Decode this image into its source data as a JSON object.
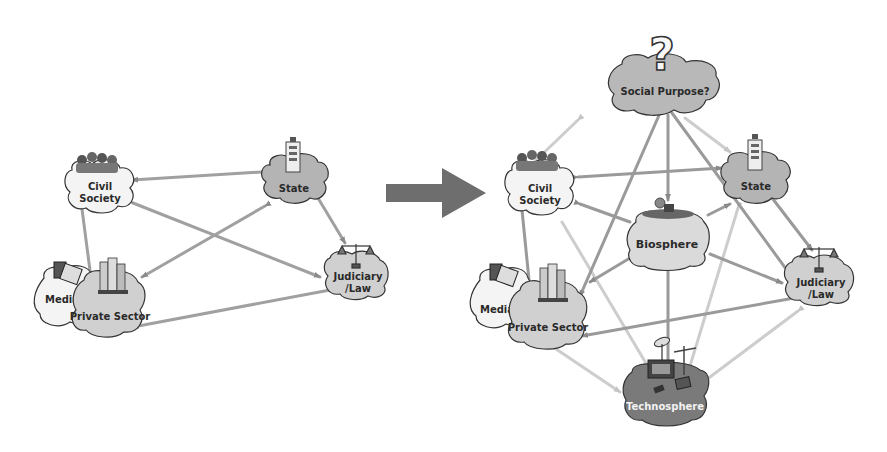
{
  "colors": {
    "cloud_white": "#f4f4f4",
    "cloud_light": "#d6d6d6",
    "cloud_mid": "#b8b8b8",
    "cloud_dark": "#7a7a7a",
    "link_dark": "#9a9a9a",
    "link_light": "#cfcfcf",
    "big_arrow": "#6e6e6e"
  },
  "left_diagram": {
    "nodes": [
      {
        "id": "civil_society",
        "label_line1": "Civil",
        "label_line2": "Society"
      },
      {
        "id": "state",
        "label_line1": "State"
      },
      {
        "id": "media",
        "label_line1": "Media"
      },
      {
        "id": "private_sector",
        "label_line1": "Private Sector"
      },
      {
        "id": "judiciary",
        "label_line1": "Judiciary",
        "label_line2": "/Law"
      }
    ]
  },
  "transition_arrow": {
    "direction": "right"
  },
  "right_diagram": {
    "nodes": [
      {
        "id": "social_purpose",
        "label_line1": "Social Purpose?",
        "icon": "question-mark"
      },
      {
        "id": "civil_society",
        "label_line1": "Civil",
        "label_line2": "Society"
      },
      {
        "id": "state",
        "label_line1": "State"
      },
      {
        "id": "biosphere",
        "label_line1": "Biosphere"
      },
      {
        "id": "media",
        "label_line1": "Media"
      },
      {
        "id": "private_sector",
        "label_line1": "Private Sector"
      },
      {
        "id": "judiciary",
        "label_line1": "Judiciary",
        "label_line2": "/Law"
      },
      {
        "id": "technosphere",
        "label_line1": "Technosphere"
      }
    ]
  }
}
